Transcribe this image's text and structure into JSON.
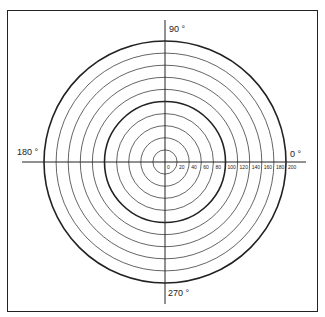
{
  "diagram": {
    "type": "polar-grid",
    "center": {
      "x": 165,
      "y": 162
    },
    "ring_spacing_px": 12.1,
    "ring_values": [
      20,
      40,
      60,
      80,
      100,
      120,
      140,
      160,
      180,
      200
    ],
    "radial_labels": [
      "0",
      "20",
      "40",
      "60",
      "80",
      "100",
      "120",
      "140",
      "160",
      "180",
      "200"
    ],
    "bold_rings": [
      100,
      200
    ],
    "angle_labels": {
      "east": "0 °",
      "north": "90 °",
      "west": "180 °",
      "south": "270 °"
    },
    "colors": {
      "line": "#222222",
      "background": "#ffffff"
    }
  }
}
